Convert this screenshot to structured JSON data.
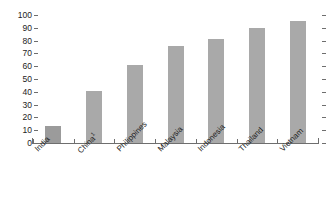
{
  "chart_data": {
    "type": "bar",
    "title": "",
    "subtitle": "",
    "xlabel": "",
    "ylabel": "",
    "categories": [
      "India",
      "China",
      "Philippines",
      "Malaysia",
      "Indonesia",
      "Thailand",
      "Vietnam"
    ],
    "category_footnotes": [
      "",
      "1",
      "",
      "",
      "",
      "",
      ""
    ],
    "values": [
      13,
      41,
      61,
      76,
      81,
      90,
      95
    ],
    "ylim": [
      0,
      100
    ],
    "ytick_values": [
      0,
      10,
      20,
      30,
      40,
      50,
      60,
      70,
      80,
      90,
      100
    ],
    "ytick_labels": [
      "0",
      "10",
      "20",
      "30",
      "40",
      "50",
      "60",
      "70",
      "80",
      "90",
      "100"
    ],
    "grid": false,
    "legend": "none",
    "bar_color": "#a9a9a9",
    "first_bar_color": "#9b9b9b",
    "axis_color": "#6e6e6e",
    "text_color": "#1c1c1c",
    "background": "#ffffff",
    "right_axis_ticks": true,
    "xtick_label_rotation": -45
  }
}
